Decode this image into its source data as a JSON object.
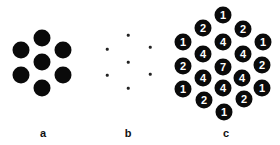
{
  "panels": {
    "a": {
      "label": "a",
      "label_pos": [
        43,
        133
      ],
      "description": "seven large black dots in hexagonal arrangement",
      "dots": [
        [
          42,
          38
        ],
        [
          21,
          50
        ],
        [
          63,
          50
        ],
        [
          42,
          62
        ],
        [
          21,
          75
        ],
        [
          63,
          75
        ],
        [
          42,
          88
        ]
      ]
    },
    "b": {
      "label": "b",
      "label_pos": [
        128,
        133
      ],
      "description": "seven tiny dots in hexagonal arrangement",
      "dots": [
        [
          128,
          35
        ],
        [
          107,
          49
        ],
        [
          150,
          47
        ],
        [
          128,
          62
        ],
        [
          107,
          75
        ],
        [
          150,
          74
        ],
        [
          128,
          88
        ]
      ]
    },
    "c": {
      "label": "c",
      "label_pos": [
        226,
        133
      ],
      "description": "nineteen numbered black dots showing overlap counts",
      "dots": [
        {
          "x": 223,
          "y": 15,
          "n": "1"
        },
        {
          "x": 203,
          "y": 28,
          "n": "2"
        },
        {
          "x": 243,
          "y": 29,
          "n": "2"
        },
        {
          "x": 183,
          "y": 42,
          "n": "1"
        },
        {
          "x": 223,
          "y": 42,
          "n": "4"
        },
        {
          "x": 263,
          "y": 42,
          "n": "1"
        },
        {
          "x": 203,
          "y": 54,
          "n": "4"
        },
        {
          "x": 243,
          "y": 54,
          "n": "4"
        },
        {
          "x": 183,
          "y": 66,
          "n": "2"
        },
        {
          "x": 223,
          "y": 67,
          "n": "7"
        },
        {
          "x": 262,
          "y": 65,
          "n": "2"
        },
        {
          "x": 203,
          "y": 78,
          "n": "4"
        },
        {
          "x": 242,
          "y": 78,
          "n": "4"
        },
        {
          "x": 183,
          "y": 89,
          "n": "1"
        },
        {
          "x": 223,
          "y": 88,
          "n": "4"
        },
        {
          "x": 262,
          "y": 88,
          "n": "1"
        },
        {
          "x": 204,
          "y": 100,
          "n": "2"
        },
        {
          "x": 244,
          "y": 99,
          "n": "2"
        },
        {
          "x": 224,
          "y": 112,
          "n": "1"
        }
      ]
    }
  },
  "colors": {
    "dot": "#0a0a0a",
    "number_text": "#ffffff",
    "background": "#ffffff"
  }
}
